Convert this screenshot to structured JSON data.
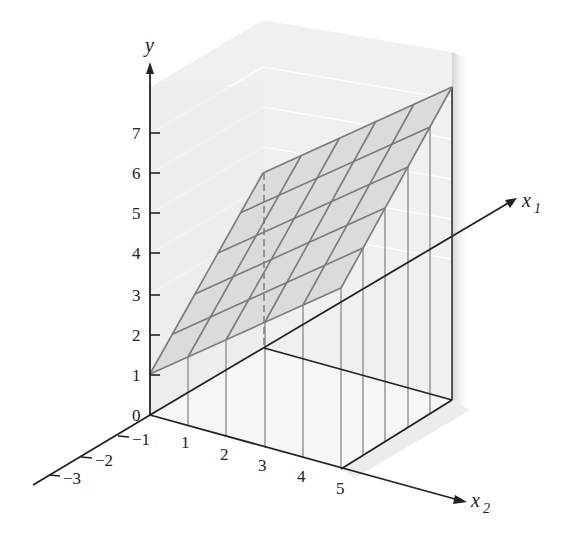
{
  "figure": {
    "type": "3d-plane-diagram",
    "axes": {
      "y": {
        "label": "y",
        "ticks": [
          "0",
          "1",
          "2",
          "3",
          "4",
          "5",
          "6",
          "7"
        ]
      },
      "x1": {
        "label": "x",
        "subscript": "1"
      },
      "x2": {
        "label": "x",
        "subscript": "2",
        "ticks": [
          "1",
          "2",
          "3",
          "4",
          "5"
        ]
      },
      "x1_negative": {
        "ticks": [
          "−1",
          "−2",
          "−3"
        ]
      }
    },
    "colors": {
      "plane_fill": "#d9d9d9",
      "plane_grid": "#777777",
      "box_fill": "#efefef",
      "axis": "#222222",
      "drop_lines": "#888888"
    },
    "plane_corners": {
      "front_left": [
        150,
        374
      ],
      "back_left": [
        263,
        173
      ],
      "front_right": [
        341,
        288
      ],
      "back_right": [
        452,
        87
      ]
    },
    "grid_divisions": 5
  }
}
